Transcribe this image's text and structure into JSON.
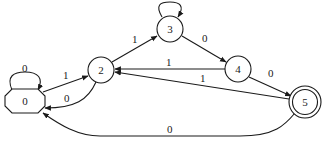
{
  "diagram": {
    "type": "finite-state-automaton",
    "nodes": [
      {
        "id": "0",
        "label": "0",
        "shape": "octagon",
        "role": "start"
      },
      {
        "id": "2",
        "label": "2",
        "shape": "circle"
      },
      {
        "id": "3",
        "label": "3",
        "shape": "circle"
      },
      {
        "id": "4",
        "label": "4",
        "shape": "circle"
      },
      {
        "id": "5",
        "label": "5",
        "shape": "doublecircle",
        "role": "accept"
      }
    ],
    "edges": [
      {
        "from": "0",
        "to": "0",
        "label": "0"
      },
      {
        "from": "0",
        "to": "2",
        "label": "1"
      },
      {
        "from": "2",
        "to": "0",
        "label": "0"
      },
      {
        "from": "2",
        "to": "3",
        "label": "1"
      },
      {
        "from": "3",
        "to": "3",
        "label": ""
      },
      {
        "from": "3",
        "to": "4",
        "label": "0"
      },
      {
        "from": "4",
        "to": "2",
        "label": "1"
      },
      {
        "from": "4",
        "to": "5",
        "label": "0"
      },
      {
        "from": "5",
        "to": "2",
        "label": "1"
      },
      {
        "from": "5",
        "to": "0",
        "label": "0"
      }
    ]
  }
}
